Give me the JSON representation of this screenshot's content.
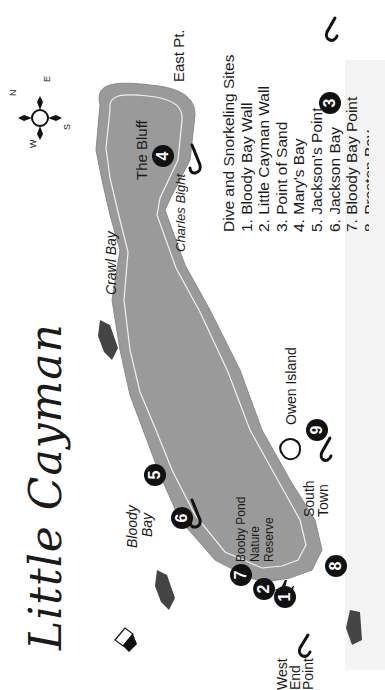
{
  "map": {
    "title": "Little Cayman",
    "colors": {
      "land": "#9a9a9a",
      "land_outline": "#f0f0f0",
      "marker": "#111111",
      "text": "#1a1a1a",
      "background": "#ffffff"
    },
    "compass": {
      "n": "N",
      "e": "E",
      "s": "S",
      "w": "W"
    },
    "places": {
      "the_bluff": "The Bluff",
      "east_pt": "East Pt.",
      "charles_bight": "Charles Bight",
      "crawl_bay": "Crawl Bay",
      "owen_island": "Owen Island",
      "south_town_1": "South",
      "south_town_2": "Town",
      "bloody_bay_1": "Bloody",
      "bloody_bay_2": "Bay",
      "booby_pond_1": "Booby Pond",
      "booby_pond_2": "Nature",
      "booby_pond_3": "Reserve",
      "west_end_1": "West",
      "west_end_2": "End",
      "west_end_3": "Point"
    },
    "markers": [
      "1",
      "2",
      "3",
      "4",
      "5",
      "6",
      "7",
      "8",
      "9"
    ],
    "legend": {
      "heading": "Dive and Snorkeling Sites",
      "items": [
        "1. Bloody Bay Wall",
        "2. Little Cayman Wall",
        "3. Point of Sand",
        "4. Mary's Bay",
        "5. Jackson's Point",
        "6. Jackson Bay",
        "7. Bloody Bay Point",
        "8. Preston Bay"
      ]
    }
  }
}
